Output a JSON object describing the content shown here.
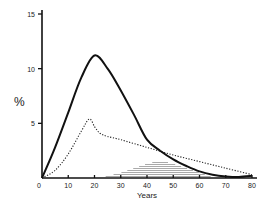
{
  "chart_data": {
    "type": "line",
    "title": "",
    "xlabel": "Years",
    "ylabel": "%",
    "xlim": [
      0,
      80
    ],
    "ylim": [
      0,
      15
    ],
    "x_ticks": [
      0,
      10,
      20,
      30,
      40,
      50,
      60,
      70,
      80
    ],
    "y_ticks": [
      5,
      10,
      15
    ],
    "grid": false,
    "legend": null,
    "series": [
      {
        "name": "solid",
        "style": "solid",
        "x": [
          0,
          5,
          10,
          15,
          20,
          25,
          30,
          35,
          40,
          45,
          50,
          55,
          60,
          65,
          70,
          75,
          80
        ],
        "values": [
          0,
          2.8,
          6.0,
          9.2,
          11.2,
          10.0,
          8.0,
          5.8,
          3.5,
          2.5,
          1.7,
          1.1,
          0.6,
          0.3,
          0.15,
          0.1,
          0.2
        ]
      },
      {
        "name": "dotted",
        "style": "dotted",
        "x": [
          0,
          5,
          10,
          15,
          18,
          20,
          22,
          25,
          30,
          40,
          50,
          60,
          70,
          80
        ],
        "values": [
          0,
          0.7,
          2.2,
          4.3,
          5.4,
          4.7,
          4.1,
          3.8,
          3.5,
          2.8,
          2.1,
          1.5,
          0.9,
          0.3
        ]
      },
      {
        "name": "shaded-distribution",
        "style": "hatched-area",
        "x": [
          22,
          30,
          40,
          45,
          50,
          60,
          66
        ],
        "values": [
          0,
          0.5,
          1.3,
          1.6,
          1.3,
          0.5,
          0
        ]
      }
    ]
  },
  "axes": {
    "y_label": "%",
    "x_label": "Years",
    "y_tick_labels": [
      "15",
      "10",
      "5"
    ],
    "x_tick_labels": [
      "0",
      "10",
      "20",
      "30",
      "40",
      "50",
      "60",
      "70",
      "80"
    ]
  }
}
